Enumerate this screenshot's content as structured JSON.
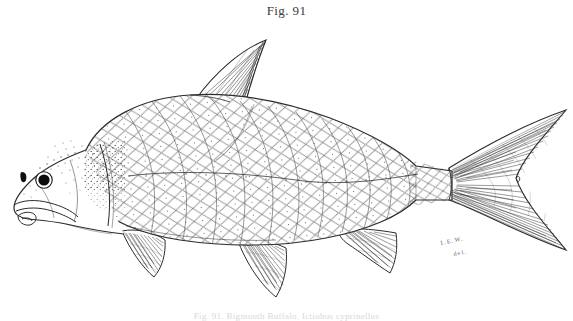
{
  "plate": {
    "figure_label": "Fig. 91",
    "caption": "Fig. 91.  Bigmouth Buffalo.  Ictiobus cyprinellus",
    "artist_signature": "I.E.W.",
    "artist_signature_2": "del.",
    "background_color": "#ffffff",
    "ink_color": "#2b2b2b",
    "stipple_color": "#555555"
  },
  "figure": {
    "type": "line-engraving",
    "orientation": "left-facing lateral view",
    "parts": [
      {
        "name": "body-outline",
        "label": "body"
      },
      {
        "name": "head",
        "label": "head"
      },
      {
        "name": "eye",
        "label": "eye",
        "cx": 44,
        "cy": 180,
        "r": 8
      },
      {
        "name": "nostril",
        "label": "nostril",
        "cx": 24,
        "cy": 176,
        "r": 2
      },
      {
        "name": "mouth",
        "label": "mouth"
      },
      {
        "name": "opercle",
        "label": "gill cover"
      },
      {
        "name": "scales",
        "label": "scale field"
      },
      {
        "name": "lateral-line",
        "label": "lateral line"
      },
      {
        "name": "dorsal-fin",
        "label": "dorsal fin",
        "rays": 28
      },
      {
        "name": "caudal-fin",
        "label": "caudal fin",
        "rays": 34
      },
      {
        "name": "pectoral-fin",
        "label": "pectoral fin",
        "rays": 16
      },
      {
        "name": "pelvic-fin",
        "label": "pelvic fin",
        "rays": 16
      },
      {
        "name": "anal-fin",
        "label": "anal fin",
        "rays": 14
      }
    ]
  }
}
